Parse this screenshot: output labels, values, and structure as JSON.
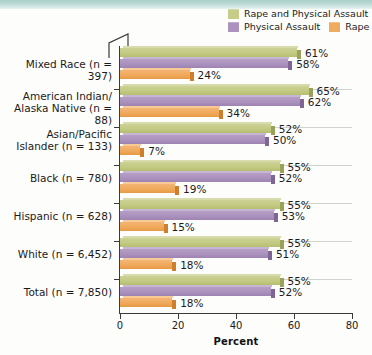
{
  "chart_data": {
    "type": "bar",
    "orientation": "horizontal",
    "title": "",
    "xlabel": "Percent",
    "ylabel": "",
    "xlim": [
      0,
      80
    ],
    "xticks": [
      0,
      20,
      40,
      60,
      80
    ],
    "grid": false,
    "legend_position": "top-right",
    "categories": [
      "Mixed Race (n = 397)",
      "American Indian/\nAlaska Native (n = 88)",
      "Asian/Pacific\nIslander (n = 133)",
      "Black (n = 780)",
      "Hispanic (n = 628)",
      "White (n = 6,452)",
      "Total (n = 7,850)"
    ],
    "category_lines": [
      [
        "Mixed Race (n = 397)"
      ],
      [
        "American Indian/",
        "Alaska Native (n = 88)"
      ],
      [
        "Asian/Pacific",
        "Islander (n = 133)"
      ],
      [
        "Black (n = 780)"
      ],
      [
        "Hispanic (n = 628)"
      ],
      [
        "White (n = 6,452)"
      ],
      [
        "Total (n = 7,850)"
      ]
    ],
    "series": [
      {
        "name": "Rape and Physical Assault",
        "color": "#c3ca82",
        "values": [
          61,
          65,
          52,
          55,
          55,
          55,
          55
        ],
        "labels": [
          "61%",
          "65%",
          "52%",
          "55%",
          "55%",
          "55%",
          "55%"
        ]
      },
      {
        "name": "Physical Assault",
        "color": "#ab92bd",
        "values": [
          58,
          62,
          50,
          52,
          53,
          51,
          52
        ],
        "labels": [
          "58%",
          "62%",
          "50%",
          "52%",
          "53%",
          "51%",
          "52%"
        ]
      },
      {
        "name": "Rape",
        "color": "#efa95c",
        "values": [
          24,
          34,
          7,
          19,
          15,
          18,
          18
        ],
        "labels": [
          "24%",
          "34%",
          "7%",
          "19%",
          "15%",
          "18%",
          "18%"
        ]
      }
    ]
  },
  "legend": {
    "items": [
      {
        "label": "Rape and Physical Assault",
        "swatch": "green"
      },
      {
        "label": "Physical Assault",
        "swatch": "purple"
      },
      {
        "label": "Rape",
        "swatch": "orange"
      }
    ]
  },
  "axis": {
    "xlabel": "Percent",
    "ticklabels": [
      "0",
      "20",
      "40",
      "60",
      "80"
    ]
  }
}
